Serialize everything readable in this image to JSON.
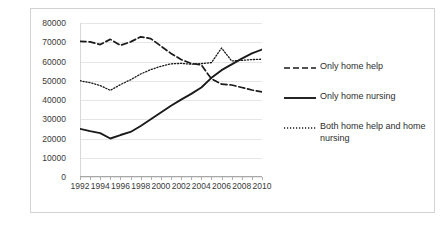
{
  "chart_data": {
    "type": "line",
    "title": "",
    "xlabel": "",
    "ylabel": "",
    "x": [
      1992,
      1993,
      1994,
      1995,
      1996,
      1997,
      1998,
      1999,
      2000,
      2001,
      2002,
      2003,
      2004,
      2005,
      2006,
      2007,
      2008,
      2009,
      2010
    ],
    "xlim": [
      1992,
      2010
    ],
    "ylim": [
      0,
      80000
    ],
    "yticks": [
      0,
      10000,
      20000,
      30000,
      40000,
      50000,
      60000,
      70000,
      80000
    ],
    "xticks": [
      1992,
      1994,
      1996,
      1998,
      2000,
      2002,
      2004,
      2006,
      2008,
      2010
    ],
    "xtick_labels": [
      "1992",
      "1994",
      "1996",
      "1998",
      "2000",
      "2002",
      "2004",
      "2006",
      "2008",
      "2010"
    ],
    "ytick_labels": [
      "0",
      "10000",
      "20000",
      "30000",
      "40000",
      "50000",
      "60000",
      "70000",
      "80000"
    ],
    "grid": true,
    "legend_position": "right",
    "series": [
      {
        "name": "Only home help",
        "style": "dashed",
        "color": "#1a1a1a",
        "values": [
          70500,
          70200,
          68800,
          71500,
          68400,
          70200,
          72800,
          71900,
          68000,
          64200,
          61000,
          59000,
          58200,
          51000,
          48200,
          47800,
          46500,
          45200,
          44200
        ]
      },
      {
        "name": "Only home nursing",
        "style": "solid",
        "color": "#1a1a1a",
        "values": [
          25000,
          23800,
          22800,
          20000,
          21800,
          23400,
          26500,
          30000,
          33500,
          37000,
          40200,
          43200,
          46500,
          51500,
          55500,
          58500,
          61500,
          64200,
          66200
        ]
      },
      {
        "name": "Both home help and home nursing",
        "style": "dotted",
        "color": "#1a1a1a",
        "values": [
          50000,
          49000,
          47500,
          45000,
          48000,
          50500,
          53500,
          55800,
          57500,
          58800,
          59000,
          58600,
          58900,
          59400,
          67000,
          60300,
          60600,
          61000,
          61200
        ]
      }
    ]
  },
  "legend": {
    "items": [
      {
        "label": "Only home help",
        "style": "dashed"
      },
      {
        "label": "Only home nursing",
        "style": "solid"
      },
      {
        "label": "Both home help and home nursing",
        "style": "dotted"
      }
    ]
  }
}
